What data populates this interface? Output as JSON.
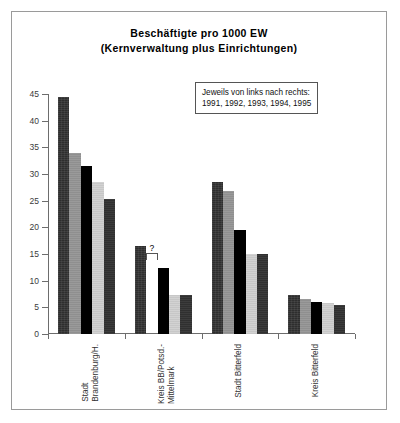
{
  "title": {
    "line1": "Beschäftigte pro 1000 EW",
    "line2": "(Kernverwaltung plus Einrichtungen)"
  },
  "legend": {
    "line1": "Jeweils von links nach rechts:",
    "line2": "1991, 1992, 1993, 1994, 1995"
  },
  "axis": {
    "y_ticks": [
      "0",
      "5",
      "10",
      "15",
      "20",
      "25",
      "30",
      "35",
      "40",
      "45"
    ]
  },
  "missing_marker": "?",
  "colors": {
    "series_1991": "#2e2e2e",
    "series_1992": "#8f8f8f",
    "series_1993": "#000000",
    "series_1994": "#d2d2d2",
    "series_1995": "#303030",
    "frame": "#9a9a9a",
    "axis": "#6d6d6d"
  },
  "chart_data": {
    "type": "bar",
    "title": "Beschäftigte pro 1000 EW (Kernverwaltung plus Einrichtungen)",
    "xlabel": "",
    "ylabel": "",
    "ylim": [
      0,
      45
    ],
    "ytick_step": 5,
    "grid": false,
    "legend_position": "inside-top-right",
    "legend_note": "Jeweils von links nach rechts: 1991, 1992, 1993, 1994, 1995",
    "categories": [
      "Stadt Brandenburg/H.",
      "Kreis BB/Potsd.-Mittelmark",
      "Stadt Bitterfeld",
      "Kreis Bitterfeld"
    ],
    "category_lines": [
      [
        "Stadt",
        "Brandenburg/H."
      ],
      [
        "Kreis BB/Potsd.-",
        "Mittelmark"
      ],
      [
        "Stadt Bitterfeld"
      ],
      [
        "Kreis Bitterfeld"
      ]
    ],
    "series": [
      {
        "name": "1991",
        "values": [
          44.5,
          16.5,
          28.5,
          7.3
        ]
      },
      {
        "name": "1992",
        "values": [
          34.0,
          null,
          26.8,
          6.6
        ]
      },
      {
        "name": "1993",
        "values": [
          31.5,
          12.3,
          19.5,
          6.0
        ]
      },
      {
        "name": "1994",
        "values": [
          28.5,
          7.3,
          15.0,
          5.8
        ]
      },
      {
        "name": "1995",
        "values": [
          25.3,
          7.3,
          15.0,
          5.5
        ]
      }
    ],
    "missing_values": [
      {
        "category": "Kreis BB/Potsd.-Mittelmark",
        "series": "1992",
        "marker": "?"
      }
    ]
  }
}
